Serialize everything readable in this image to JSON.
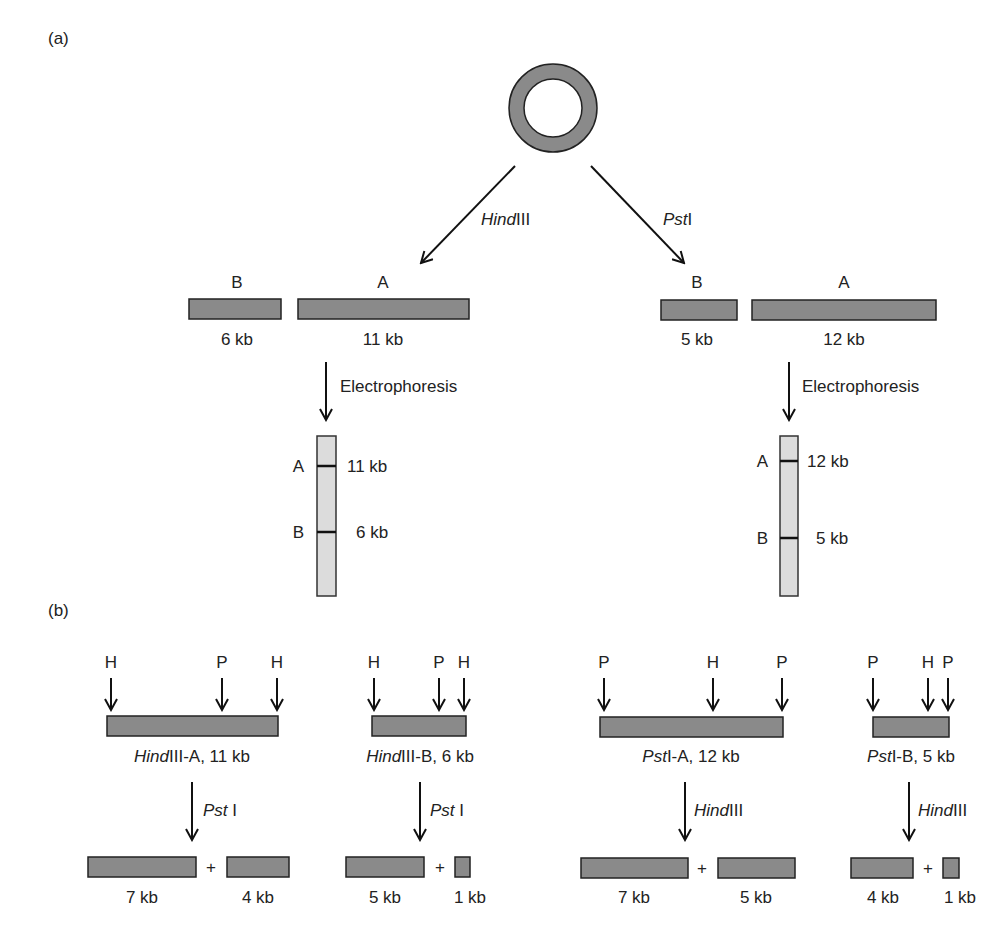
{
  "panel_a": {
    "label": "(a)",
    "plasmid": {
      "shape": "circular-dna-ring",
      "total_kb": 17,
      "fill": "#8a8a8a"
    },
    "digest_left": {
      "enzyme": "HindIII",
      "enzyme_italic": "Hind",
      "enzyme_roman": "III",
      "fragments": [
        {
          "name": "B",
          "size": "6 kb"
        },
        {
          "name": "A",
          "size": "11 kb"
        }
      ],
      "process": "Electrophoresis",
      "gel_bands": [
        {
          "name": "A",
          "size": "11 kb"
        },
        {
          "name": "B",
          "size": "6 kb"
        }
      ]
    },
    "digest_right": {
      "enzyme": "PstI",
      "enzyme_italic": "Pst",
      "enzyme_roman": "I",
      "fragments": [
        {
          "name": "B",
          "size": "5 kb"
        },
        {
          "name": "A",
          "size": "12 kb"
        }
      ],
      "process": "Electrophoresis",
      "gel_bands": [
        {
          "name": "A",
          "size": "12 kb"
        },
        {
          "name": "B",
          "size": "5 kb"
        }
      ]
    }
  },
  "panel_b": {
    "label": "(b)",
    "plus": "+",
    "maps": [
      {
        "sites": [
          "H",
          "P",
          "H"
        ],
        "name_italic": "Hind",
        "name_rest": "III-A, 11 kb",
        "enzyme_italic": "Pst",
        "enzyme_roman": " I",
        "products": [
          "7 kb",
          "4 kb"
        ]
      },
      {
        "sites": [
          "H",
          "P",
          "H"
        ],
        "name_italic": "Hind",
        "name_rest": "III-B, 6 kb",
        "enzyme_italic": "Pst",
        "enzyme_roman": " I",
        "products": [
          "5 kb",
          "1 kb"
        ]
      },
      {
        "sites": [
          "P",
          "H",
          "P"
        ],
        "name_italic": "Pst",
        "name_rest": "I-A, 12 kb",
        "enzyme_italic": "Hind",
        "enzyme_roman": "III",
        "products": [
          "7 kb",
          "5 kb"
        ]
      },
      {
        "sites": [
          "P",
          "H",
          "P"
        ],
        "name_italic": "Pst",
        "name_rest": "I-B, 5 kb",
        "enzyme_italic": "Hind",
        "enzyme_roman": "III",
        "products": [
          "4 kb",
          "1 kb"
        ]
      }
    ]
  },
  "colors": {
    "fragment": "#8a8a8a",
    "gel_lane": "#dcdcdc",
    "ink": "#222222"
  }
}
